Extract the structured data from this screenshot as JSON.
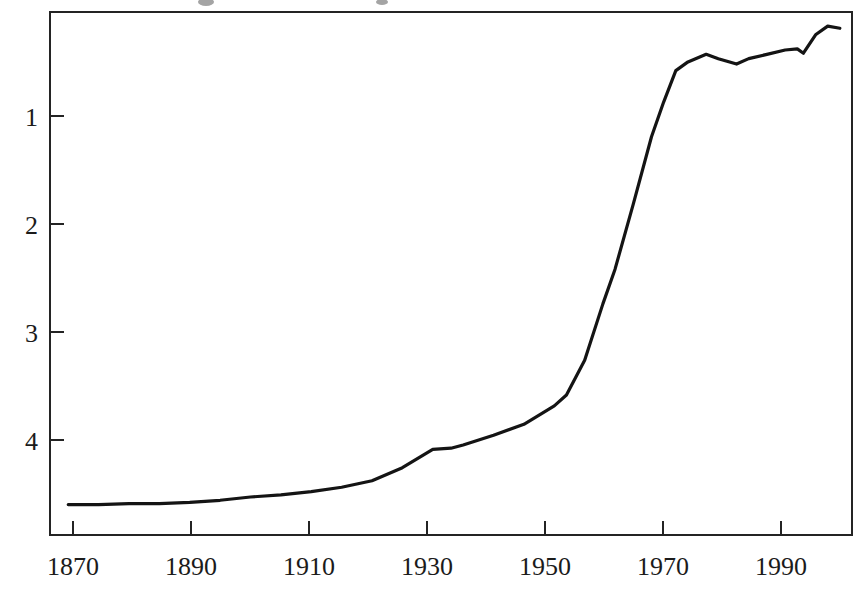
{
  "chart_data": {
    "type": "line",
    "title": "",
    "subtitle": "",
    "xlabel": "",
    "ylabel": "",
    "xlim": [
      1867,
      1999
    ],
    "ylim": [
      0.1,
      4.92
    ],
    "xticks": [
      1870,
      1890,
      1910,
      1930,
      1950,
      1970,
      1990
    ],
    "xtick_labels": [
      "1870",
      "1890",
      "1910",
      "1930",
      "1950",
      "1970",
      "1990"
    ],
    "yticks": [
      1,
      2,
      3,
      4
    ],
    "ytick_labels": [
      "1",
      "2",
      "3",
      "4"
    ],
    "grid": false,
    "legend": "none",
    "line_color": "#141414",
    "series": [
      {
        "name": "series-1",
        "x": [
          1870,
          1875,
          1880,
          1885,
          1890,
          1895,
          1900,
          1905,
          1910,
          1915,
          1920,
          1925,
          1930,
          1933,
          1935,
          1940,
          1945,
          1950,
          1952,
          1955,
          1958,
          1960,
          1963,
          1966,
          1968,
          1970,
          1972,
          1975,
          1977,
          1980,
          1982,
          1985,
          1988,
          1990,
          1991,
          1993,
          1995,
          1997
        ],
        "y": [
          0.38,
          0.38,
          0.39,
          0.39,
          0.4,
          0.42,
          0.45,
          0.47,
          0.5,
          0.54,
          0.6,
          0.72,
          0.89,
          0.9,
          0.93,
          1.02,
          1.12,
          1.29,
          1.39,
          1.71,
          2.23,
          2.55,
          3.15,
          3.77,
          4.09,
          4.38,
          4.46,
          4.53,
          4.49,
          4.44,
          4.49,
          4.53,
          4.57,
          4.58,
          4.54,
          4.71,
          4.79,
          4.77
        ]
      }
    ],
    "annotations": []
  },
  "frame": {
    "left_px": 50,
    "right_px": 852,
    "top_px": 12,
    "bottom_px": 535
  }
}
